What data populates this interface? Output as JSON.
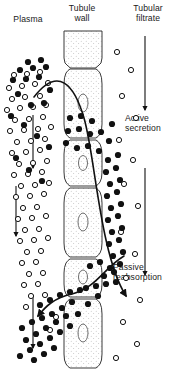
{
  "figure": {
    "columns": {
      "plasma": "Plasma",
      "tubule_wall": "Tubule\nwall",
      "tubule_wall_line1": "Tubule",
      "tubule_wall_line2": "wall",
      "tubular_filtrate_line1": "Tubular",
      "tubular_filtrate_line2": "filtrate"
    },
    "annotations": {
      "active_secretion_line1": "Active",
      "active_secretion_line2": "secretion",
      "passive_reabsorption_line1": "Passive",
      "passive_reabsorption_line2": "reabsorption"
    },
    "colors": {
      "ink": "#111111",
      "background": "#ffffff",
      "cell_fill": "#fdfdfd",
      "stipple": "#9a9a9a"
    },
    "legend_semantics": {
      "filled_dot": "bound or transported drug molecule",
      "open_circle": "free drug molecule"
    },
    "flow_arrows": {
      "plasma_direction": "downward",
      "filtrate_direction": "downward",
      "count_left": 3,
      "count_right": 2
    }
  },
  "chart_data": {
    "type": "diagram",
    "cells": [
      {
        "index": 0,
        "y_top": 31,
        "y_bottom": 67,
        "nucleus": false
      },
      {
        "index": 1,
        "y_top": 68,
        "y_bottom": 138,
        "nucleus": true
      },
      {
        "index": 2,
        "y_top": 139,
        "y_bottom": 186,
        "nucleus": true
      },
      {
        "index": 3,
        "y_top": 187,
        "y_bottom": 257,
        "nucleus": true
      },
      {
        "index": 4,
        "y_top": 258,
        "y_bottom": 297,
        "nucleus": true
      },
      {
        "index": 5,
        "y_top": 298,
        "y_bottom": 368,
        "nucleus": true
      }
    ],
    "wall_x_left": 62,
    "wall_x_right": 104,
    "open_circles": [
      [
        14,
        75
      ],
      [
        27,
        74
      ],
      [
        40,
        72
      ],
      [
        9,
        88
      ],
      [
        22,
        86
      ],
      [
        35,
        84
      ],
      [
        48,
        83
      ],
      [
        12,
        99
      ],
      [
        25,
        97
      ],
      [
        40,
        96
      ],
      [
        7,
        110
      ],
      [
        20,
        108
      ],
      [
        33,
        107
      ],
      [
        46,
        105
      ],
      [
        15,
        120
      ],
      [
        29,
        119
      ],
      [
        43,
        117
      ],
      [
        10,
        131
      ],
      [
        24,
        130
      ],
      [
        38,
        129
      ],
      [
        51,
        127
      ],
      [
        17,
        142
      ],
      [
        31,
        141
      ],
      [
        45,
        139
      ],
      [
        12,
        153
      ],
      [
        26,
        152
      ],
      [
        40,
        150
      ],
      [
        19,
        164
      ],
      [
        33,
        163
      ],
      [
        47,
        161
      ],
      [
        14,
        175
      ],
      [
        28,
        174
      ],
      [
        42,
        172
      ],
      [
        21,
        186
      ],
      [
        35,
        185
      ],
      [
        49,
        183
      ],
      [
        16,
        197
      ],
      [
        30,
        196
      ],
      [
        44,
        194
      ],
      [
        23,
        208
      ],
      [
        37,
        207
      ],
      [
        18,
        219
      ],
      [
        32,
        218
      ],
      [
        46,
        216
      ],
      [
        25,
        230
      ],
      [
        39,
        229
      ],
      [
        20,
        241
      ],
      [
        34,
        240
      ],
      [
        48,
        238
      ],
      [
        27,
        252
      ],
      [
        41,
        251
      ],
      [
        22,
        263
      ],
      [
        36,
        262
      ],
      [
        29,
        274
      ],
      [
        43,
        273
      ],
      [
        24,
        285
      ],
      [
        38,
        284
      ],
      [
        31,
        296
      ],
      [
        45,
        295
      ],
      [
        26,
        307
      ],
      [
        117,
        52
      ],
      [
        131,
        70
      ],
      [
        122,
        96
      ],
      [
        136,
        118
      ],
      [
        119,
        140
      ],
      [
        133,
        160
      ],
      [
        124,
        184
      ],
      [
        138,
        206
      ],
      [
        121,
        232
      ],
      [
        135,
        254
      ],
      [
        126,
        278
      ],
      [
        140,
        300
      ],
      [
        123,
        322
      ],
      [
        137,
        344
      ],
      [
        116,
        358
      ],
      [
        56,
        317
      ],
      [
        50,
        330
      ]
    ],
    "filled_dots": [
      [
        28,
        62
      ],
      [
        41,
        60
      ],
      [
        20,
        70
      ],
      [
        33,
        68
      ],
      [
        46,
        67
      ],
      [
        13,
        80
      ],
      [
        26,
        79
      ],
      [
        39,
        77
      ],
      [
        50,
        90
      ],
      [
        18,
        94
      ],
      [
        31,
        105
      ],
      [
        44,
        103
      ],
      [
        11,
        116
      ],
      [
        24,
        125
      ],
      [
        37,
        136
      ],
      [
        49,
        147
      ],
      [
        16,
        158
      ],
      [
        29,
        170
      ],
      [
        42,
        181
      ],
      [
        70,
        118
      ],
      [
        81,
        116
      ],
      [
        92,
        121
      ],
      [
        68,
        131
      ],
      [
        79,
        129
      ],
      [
        90,
        134
      ],
      [
        101,
        132
      ],
      [
        66,
        143
      ],
      [
        77,
        148
      ],
      [
        88,
        146
      ],
      [
        99,
        151
      ],
      [
        109,
        141
      ],
      [
        112,
        124
      ],
      [
        108,
        160
      ],
      [
        118,
        155
      ],
      [
        106,
        172
      ],
      [
        116,
        168
      ],
      [
        110,
        184
      ],
      [
        120,
        180
      ],
      [
        107,
        196
      ],
      [
        117,
        192
      ],
      [
        111,
        208
      ],
      [
        121,
        204
      ],
      [
        108,
        220
      ],
      [
        118,
        216
      ],
      [
        112,
        232
      ],
      [
        122,
        228
      ],
      [
        109,
        244
      ],
      [
        119,
        240
      ],
      [
        113,
        256
      ],
      [
        123,
        252
      ],
      [
        110,
        268
      ],
      [
        120,
        264
      ],
      [
        100,
        262
      ],
      [
        90,
        266
      ],
      [
        104,
        276
      ],
      [
        114,
        272
      ],
      [
        96,
        286
      ],
      [
        86,
        288
      ],
      [
        106,
        284
      ],
      [
        116,
        282
      ],
      [
        70,
        292
      ],
      [
        80,
        290
      ],
      [
        60,
        295
      ],
      [
        50,
        300
      ],
      [
        40,
        305
      ],
      [
        72,
        302
      ],
      [
        62,
        308
      ],
      [
        52,
        314
      ],
      [
        42,
        318
      ],
      [
        32,
        322
      ],
      [
        22,
        328
      ],
      [
        66,
        316
      ],
      [
        56,
        322
      ],
      [
        46,
        328
      ],
      [
        36,
        334
      ],
      [
        26,
        340
      ],
      [
        60,
        332
      ],
      [
        50,
        338
      ],
      [
        40,
        344
      ],
      [
        30,
        350
      ],
      [
        20,
        356
      ],
      [
        54,
        348
      ],
      [
        44,
        354
      ],
      [
        34,
        360
      ],
      [
        70,
        326
      ],
      [
        78,
        314
      ],
      [
        88,
        304
      ],
      [
        98,
        296
      ]
    ],
    "curve_active_secretion": {
      "from": "plasma upper-left",
      "to": "tubular filtrate mid-right",
      "arrowhead_at": [
        130,
        301
      ]
    },
    "curve_passive_reabsorption": {
      "from": "tubular filtrate upper-right",
      "to": "plasma lower-left",
      "arrowhead_at": [
        40,
        320
      ]
    }
  }
}
